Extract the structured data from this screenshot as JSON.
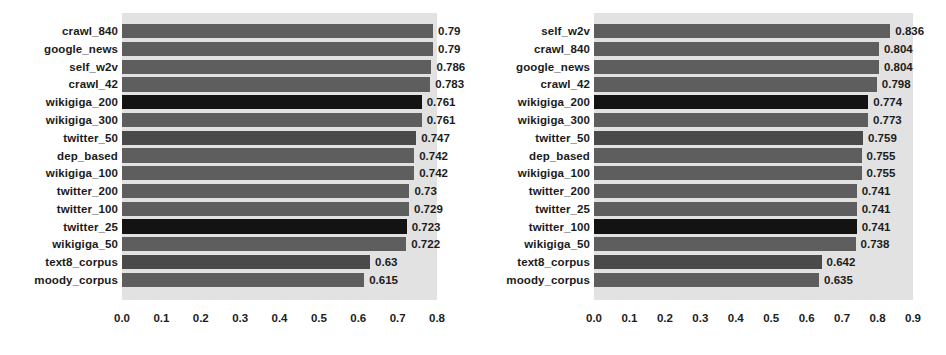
{
  "figure": {
    "background_color": "#ffffff",
    "plot_background_color": "#e2e2e2",
    "bar_color": "#5e5e5e",
    "bar_color_dark": "#131313",
    "label_color": "#1b1b1b"
  },
  "chart_data": [
    {
      "type": "bar",
      "orientation": "horizontal",
      "title": "",
      "xlabel": "",
      "ylabel": "",
      "xlim": [
        0.0,
        0.8
      ],
      "grid": false,
      "legend": "none",
      "xticks": [
        "0.0",
        "0.1",
        "0.2",
        "0.3",
        "0.4",
        "0.5",
        "0.6",
        "0.7",
        "0.8"
      ],
      "xtick_values": [
        0.0,
        0.1,
        0.2,
        0.3,
        0.4,
        0.5,
        0.6,
        0.7,
        0.8
      ],
      "categories": [
        "crawl_840",
        "google_news",
        "self_w2v",
        "crawl_42",
        "wikigiga_200",
        "wikigiga_300",
        "twitter_50",
        "dep_based",
        "wikigiga_100",
        "twitter_200",
        "twitter_100",
        "twitter_25",
        "wikigiga_50",
        "text8_corpus",
        "moody_corpus"
      ],
      "values": [
        0.79,
        0.79,
        0.786,
        0.783,
        0.761,
        0.761,
        0.747,
        0.742,
        0.742,
        0.73,
        0.729,
        0.723,
        0.722,
        0.63,
        0.615
      ],
      "value_labels": [
        "0.79",
        "0.79",
        "0.786",
        "0.783",
        "0.761",
        "0.761",
        "0.747",
        "0.742",
        "0.742",
        "0.73",
        "0.729",
        "0.723",
        "0.722",
        "0.63",
        "0.615"
      ],
      "shades": [
        "normal",
        "normal",
        "normal",
        "normal",
        "dark",
        "normal",
        "mid",
        "normal",
        "normal",
        "normal",
        "normal",
        "dark",
        "normal",
        "mid",
        "normal"
      ]
    },
    {
      "type": "bar",
      "orientation": "horizontal",
      "title": "",
      "xlabel": "",
      "ylabel": "",
      "xlim": [
        0.0,
        0.9
      ],
      "grid": false,
      "legend": "none",
      "xticks": [
        "0.0",
        "0.1",
        "0.2",
        "0.3",
        "0.4",
        "0.5",
        "0.6",
        "0.7",
        "0.8",
        "0.9"
      ],
      "xtick_values": [
        0.0,
        0.1,
        0.2,
        0.3,
        0.4,
        0.5,
        0.6,
        0.7,
        0.8,
        0.9
      ],
      "categories": [
        "self_w2v",
        "crawl_840",
        "google_news",
        "crawl_42",
        "wikigiga_200",
        "wikigiga_300",
        "twitter_50",
        "dep_based",
        "wikigiga_100",
        "twitter_200",
        "twitter_25",
        "twitter_100",
        "wikigiga_50",
        "text8_corpus",
        "moody_corpus"
      ],
      "values": [
        0.836,
        0.804,
        0.804,
        0.798,
        0.774,
        0.773,
        0.759,
        0.755,
        0.755,
        0.741,
        0.741,
        0.741,
        0.738,
        0.642,
        0.635
      ],
      "value_labels": [
        "0.836",
        "0.804",
        "0.804",
        "0.798",
        "0.774",
        "0.773",
        "0.759",
        "0.755",
        "0.755",
        "0.741",
        "0.741",
        "0.741",
        "0.738",
        "0.642",
        "0.635"
      ],
      "shades": [
        "normal",
        "normal",
        "normal",
        "normal",
        "dark",
        "normal",
        "mid",
        "normal",
        "normal",
        "normal",
        "normal",
        "dark",
        "normal",
        "mid",
        "normal"
      ]
    }
  ]
}
